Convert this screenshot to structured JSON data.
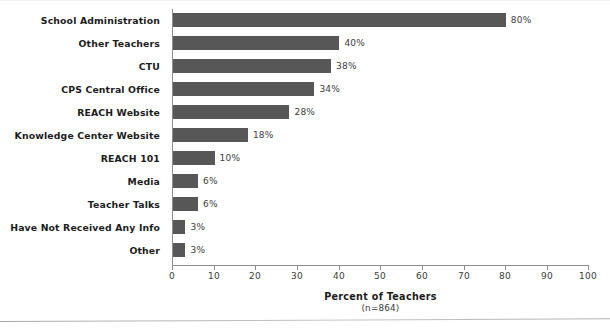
{
  "chart_data": {
    "type": "bar",
    "orientation": "horizontal",
    "title": "",
    "xlabel": "Percent of Teachers",
    "sublabel": "(n=864)",
    "ylabel": "",
    "xlim": [
      0,
      100
    ],
    "xticks": [
      "0",
      "10",
      "20",
      "30",
      "40",
      "50",
      "60",
      "70",
      "80",
      "90",
      "100"
    ],
    "xtick_values": [
      0,
      10,
      20,
      30,
      40,
      50,
      60,
      70,
      80,
      90,
      100
    ],
    "grid": false,
    "legend": "none",
    "bar_color": "#575757",
    "axis_color": "#8d8d8d",
    "categories": [
      "School Administration",
      "Other Teachers",
      "CTU",
      "CPS Central Office",
      "REACH Website",
      "Knowledge Center Website",
      "REACH 101",
      "Media",
      "Teacher Talks",
      "Have Not Received Any Info",
      "Other"
    ],
    "values": [
      80,
      40,
      38,
      34,
      28,
      18,
      10,
      6,
      6,
      3,
      3
    ],
    "value_labels": [
      "80%",
      "40%",
      "38%",
      "34%",
      "28%",
      "18%",
      "10%",
      "6%",
      "6%",
      "3%",
      "3%"
    ]
  }
}
